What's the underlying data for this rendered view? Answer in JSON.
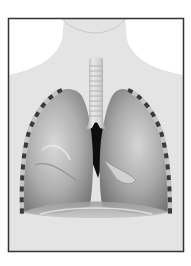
{
  "figure": {
    "style": "grayscale illustration",
    "parts": [
      "torso-silhouette",
      "trachea",
      "left-lung",
      "right-lung",
      "ribs",
      "diaphragm",
      "heart-space"
    ]
  },
  "colors": {
    "background": "#ffffff",
    "frame": "#333333",
    "body": "#e4e4e4",
    "lung_light": "#d8d8d8",
    "lung_mid": "#a9a9a9",
    "lung_dark": "#6a6a6a",
    "trachea": "#dcdcdc",
    "rib_mark": "#3a3a3a",
    "rib_gap": "#bdbdbd",
    "mediastinum": "#0d0d0d"
  }
}
